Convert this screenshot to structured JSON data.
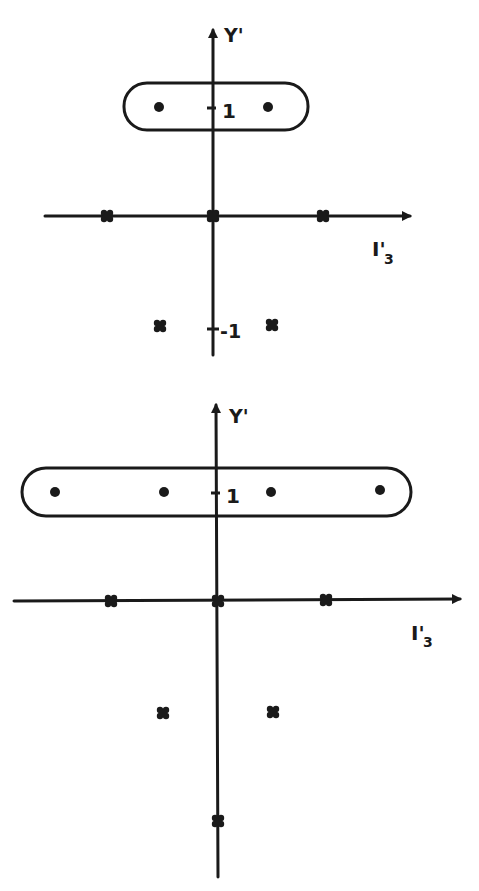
{
  "diagrams": [
    {
      "id": "top",
      "y_axis_label": "Y'",
      "x_axis_label": "I'3",
      "x_axis_label_main": "I'",
      "x_axis_label_sub": "3",
      "tick_labels": {
        "plus_one": "1",
        "minus_one": "-1"
      },
      "circled_points": [
        {
          "i3": -0.5,
          "y": 1
        },
        {
          "i3": 0.5,
          "y": 1
        }
      ],
      "cross_points": [
        {
          "i3": -1,
          "y": 0
        },
        {
          "i3": 0,
          "y": 0
        },
        {
          "i3": 1,
          "y": 0
        },
        {
          "i3": -0.5,
          "y": -1
        },
        {
          "i3": 0.5,
          "y": -1
        }
      ]
    },
    {
      "id": "bottom",
      "y_axis_label": "Y'",
      "x_axis_label": "I'3",
      "x_axis_label_main": "I'",
      "x_axis_label_sub": "3",
      "tick_labels": {
        "plus_one": "1"
      },
      "circled_points": [
        {
          "i3": -1.5,
          "y": 1
        },
        {
          "i3": -0.5,
          "y": 1
        },
        {
          "i3": 0.5,
          "y": 1
        },
        {
          "i3": 1.5,
          "y": 1
        }
      ],
      "cross_points": [
        {
          "i3": -1,
          "y": 0
        },
        {
          "i3": 0,
          "y": 0
        },
        {
          "i3": 1,
          "y": 0
        },
        {
          "i3": -0.5,
          "y": -1
        },
        {
          "i3": 0.5,
          "y": -1
        },
        {
          "i3": 0,
          "y": -2
        }
      ]
    }
  ]
}
